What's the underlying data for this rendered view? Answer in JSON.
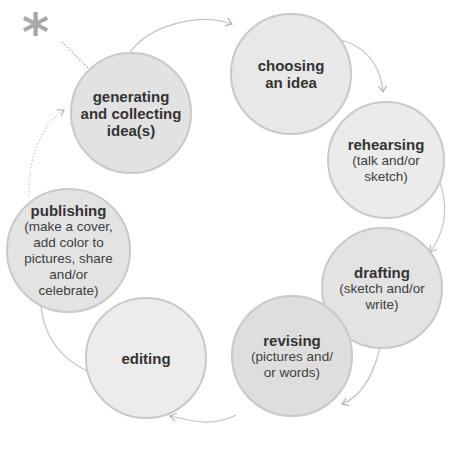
{
  "diagram": {
    "type": "cycle",
    "start_marker": "asterisk",
    "colors": {
      "node_fill": "#e4e4e4",
      "node_fill_light": "#ececec",
      "node_border": "#c9c9c9",
      "arrow": "#b5b5b5",
      "star": "#a8a8a8",
      "text": "#333333"
    },
    "nodes": [
      {
        "id": "generating",
        "title": "generating and collecting idea(s)",
        "title_lines": [
          "generating",
          "and collecting",
          "idea(s)"
        ],
        "sub_lines": []
      },
      {
        "id": "choosing",
        "title": "choosing an idea",
        "title_lines": [
          "choosing",
          "an idea"
        ],
        "sub_lines": []
      },
      {
        "id": "rehearsing",
        "title": "rehearsing",
        "title_lines": [
          "rehearsing"
        ],
        "sub_lines": [
          "(talk and/or",
          "sketch)"
        ]
      },
      {
        "id": "drafting",
        "title": "drafting",
        "title_lines": [
          "drafting"
        ],
        "sub_lines": [
          "(sketch and/or",
          "write)"
        ]
      },
      {
        "id": "revising",
        "title": "revising",
        "title_lines": [
          "revising"
        ],
        "sub_lines": [
          "(pictures and/",
          "or words)"
        ]
      },
      {
        "id": "editing",
        "title": "editing",
        "title_lines": [
          "editing"
        ],
        "sub_lines": []
      },
      {
        "id": "publishing",
        "title": "publishing",
        "title_lines": [
          "publishing"
        ],
        "sub_lines": [
          "(make a cover,",
          "add color to",
          "pictures, share",
          "and/or",
          "celebrate)"
        ]
      }
    ],
    "star_glyph": "*"
  }
}
